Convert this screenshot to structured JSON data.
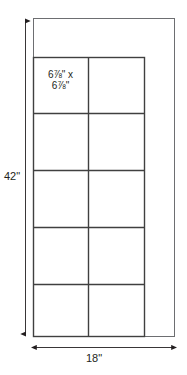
{
  "diagram": {
    "type": "technical-dimension-drawing",
    "background_color": "#ffffff",
    "outline_color": "#58595b",
    "grid_color": "#404040",
    "text_color": "#231f20",
    "outer_panel": {
      "name": "door-panel-outline",
      "x": 33,
      "y": 18,
      "width": 142,
      "height": 319
    },
    "inner_grid": {
      "name": "glass-lite-grid",
      "x": 33,
      "y": 57,
      "width": 112,
      "height": 280,
      "columns": 2,
      "rows": 5,
      "column_divider_x": [
        88
      ],
      "row_divider_y": [
        113,
        170,
        227,
        284
      ]
    },
    "cell_note": {
      "line1": "6⅞\" x",
      "line2": "6⅞\""
    },
    "dimensions": {
      "height": {
        "label": "42\"",
        "orientation": "vertical",
        "line_x": 25,
        "y_start": 18,
        "y_end": 337
      },
      "width": {
        "label": "18\"",
        "orientation": "horizontal",
        "line_y": 347,
        "x_start": 33,
        "x_end": 175
      }
    }
  }
}
